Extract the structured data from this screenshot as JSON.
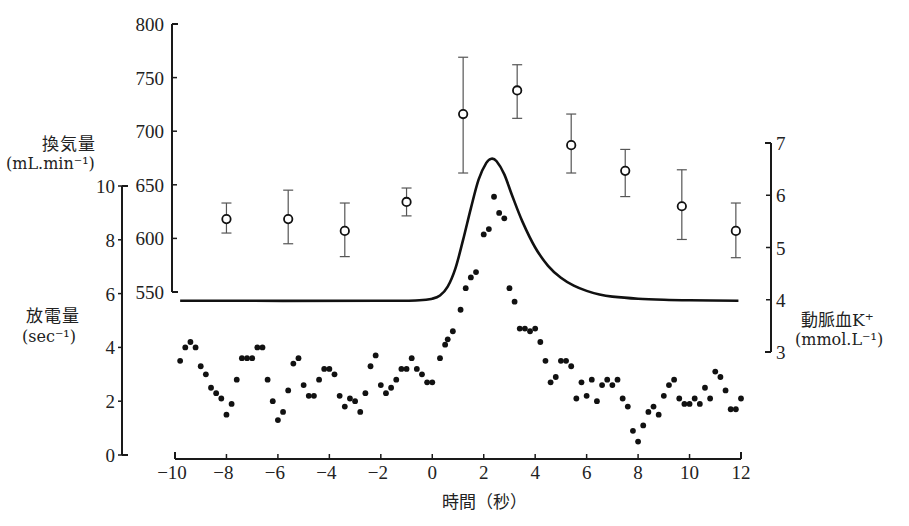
{
  "chart_data": {
    "type": "scatter",
    "title": "",
    "xlabel": "時間（秒）",
    "xlim": [
      -10,
      12
    ],
    "xticks": [
      -10,
      -8,
      -6,
      -4,
      -2,
      0,
      2,
      4,
      6,
      8,
      10,
      12
    ],
    "axes": {
      "ventilation": {
        "label": "換気量",
        "unit": "(mL.min⁻¹)",
        "ylim": [
          550,
          800
        ],
        "ticks": [
          550,
          600,
          650,
          700,
          750,
          800
        ],
        "position": "left-inner"
      },
      "discharge": {
        "label": "放電量",
        "unit": "(sec⁻¹)",
        "ylim": [
          0,
          10
        ],
        "ticks": [
          0,
          2,
          4,
          6,
          8,
          10
        ],
        "position": "left-outer"
      },
      "potassium": {
        "label": "動脈血K⁺",
        "unit": "(mmol.L⁻¹)",
        "ylim": [
          3,
          7
        ],
        "ticks": [
          3,
          4,
          5,
          6,
          7
        ],
        "position": "right"
      }
    },
    "series": [
      {
        "name": "換気量",
        "type": "scatter-errorbar",
        "marker": "open-circle",
        "axis": "ventilation",
        "points": [
          {
            "x": -8.0,
            "y": 618,
            "lo": 605,
            "hi": 633
          },
          {
            "x": -5.6,
            "y": 618,
            "lo": 595,
            "hi": 645
          },
          {
            "x": -3.4,
            "y": 607,
            "lo": 583,
            "hi": 633
          },
          {
            "x": -1.0,
            "y": 634,
            "lo": 621,
            "hi": 647
          },
          {
            "x": 1.2,
            "y": 716,
            "lo": 661,
            "hi": 769
          },
          {
            "x": 3.3,
            "y": 738,
            "lo": 712,
            "hi": 762
          },
          {
            "x": 5.4,
            "y": 687,
            "lo": 661,
            "hi": 716
          },
          {
            "x": 7.5,
            "y": 663,
            "lo": 639,
            "hi": 683
          },
          {
            "x": 9.7,
            "y": 630,
            "lo": 599,
            "hi": 664
          },
          {
            "x": 11.8,
            "y": 607,
            "lo": 582,
            "hi": 633
          }
        ]
      },
      {
        "name": "動脈血K⁺",
        "type": "line",
        "axis": "potassium",
        "points": [
          [
            -9.8,
            3.98
          ],
          [
            -2,
            3.98
          ],
          [
            -0.5,
            3.99
          ],
          [
            0,
            4.02
          ],
          [
            0.3,
            4.08
          ],
          [
            0.6,
            4.25
          ],
          [
            0.9,
            4.6
          ],
          [
            1.2,
            5.15
          ],
          [
            1.5,
            5.75
          ],
          [
            1.8,
            6.3
          ],
          [
            2.1,
            6.62
          ],
          [
            2.3,
            6.7
          ],
          [
            2.5,
            6.65
          ],
          [
            2.8,
            6.4
          ],
          [
            3.1,
            6.0
          ],
          [
            3.5,
            5.5
          ],
          [
            4.0,
            5.0
          ],
          [
            4.5,
            4.65
          ],
          [
            5.0,
            4.42
          ],
          [
            5.5,
            4.27
          ],
          [
            6.0,
            4.17
          ],
          [
            6.5,
            4.1
          ],
          [
            7.0,
            4.06
          ],
          [
            8.0,
            4.02
          ],
          [
            9.0,
            4.0
          ],
          [
            10.0,
            3.99
          ],
          [
            11.9,
            3.98
          ]
        ]
      },
      {
        "name": "放電量",
        "type": "scatter",
        "marker": "filled-dot",
        "axis": "discharge",
        "points": [
          [
            -9.8,
            3.5
          ],
          [
            -9.6,
            4.0
          ],
          [
            -9.4,
            4.2
          ],
          [
            -9.2,
            4.0
          ],
          [
            -9.0,
            3.3
          ],
          [
            -8.8,
            3.0
          ],
          [
            -8.6,
            2.5
          ],
          [
            -8.4,
            2.3
          ],
          [
            -8.2,
            2.1
          ],
          [
            -8.0,
            1.5
          ],
          [
            -7.8,
            1.9
          ],
          [
            -7.6,
            2.8
          ],
          [
            -7.4,
            3.6
          ],
          [
            -7.2,
            3.6
          ],
          [
            -7.0,
            3.6
          ],
          [
            -6.8,
            4.0
          ],
          [
            -6.6,
            4.0
          ],
          [
            -6.4,
            2.8
          ],
          [
            -6.2,
            2.0
          ],
          [
            -6.0,
            1.3
          ],
          [
            -5.8,
            1.6
          ],
          [
            -5.6,
            2.4
          ],
          [
            -5.4,
            3.4
          ],
          [
            -5.2,
            3.6
          ],
          [
            -5.0,
            2.6
          ],
          [
            -4.8,
            2.2
          ],
          [
            -4.6,
            2.2
          ],
          [
            -4.4,
            2.8
          ],
          [
            -4.2,
            3.2
          ],
          [
            -4.0,
            3.2
          ],
          [
            -3.8,
            3.0
          ],
          [
            -3.6,
            2.2
          ],
          [
            -3.4,
            1.8
          ],
          [
            -3.2,
            2.1
          ],
          [
            -3.0,
            2.0
          ],
          [
            -2.8,
            1.6
          ],
          [
            -2.6,
            2.3
          ],
          [
            -2.4,
            3.3
          ],
          [
            -2.2,
            3.7
          ],
          [
            -2.0,
            2.6
          ],
          [
            -1.8,
            2.3
          ],
          [
            -1.6,
            2.5
          ],
          [
            -1.4,
            2.8
          ],
          [
            -1.2,
            3.2
          ],
          [
            -1.0,
            3.2
          ],
          [
            -0.8,
            3.6
          ],
          [
            -0.6,
            3.2
          ],
          [
            -0.4,
            3.0
          ],
          [
            -0.2,
            2.7
          ],
          [
            0.0,
            2.7
          ],
          [
            0.3,
            3.6
          ],
          [
            0.5,
            4.1
          ],
          [
            0.6,
            4.3
          ],
          [
            0.8,
            4.6
          ],
          [
            1.1,
            5.4
          ],
          [
            1.3,
            6.2
          ],
          [
            1.5,
            6.6
          ],
          [
            1.7,
            6.8
          ],
          [
            2.0,
            8.2
          ],
          [
            2.2,
            8.4
          ],
          [
            2.4,
            9.6
          ],
          [
            2.6,
            9.0
          ],
          [
            2.8,
            8.8
          ],
          [
            3.0,
            6.2
          ],
          [
            3.2,
            5.7
          ],
          [
            3.4,
            4.7
          ],
          [
            3.6,
            4.7
          ],
          [
            3.8,
            4.6
          ],
          [
            4.0,
            4.7
          ],
          [
            4.2,
            4.2
          ],
          [
            4.4,
            3.5
          ],
          [
            4.6,
            2.7
          ],
          [
            4.8,
            2.9
          ],
          [
            5.0,
            3.5
          ],
          [
            5.2,
            3.5
          ],
          [
            5.4,
            3.3
          ],
          [
            5.6,
            2.1
          ],
          [
            5.8,
            2.7
          ],
          [
            6.0,
            2.2
          ],
          [
            6.2,
            2.8
          ],
          [
            6.4,
            2.0
          ],
          [
            6.6,
            2.6
          ],
          [
            6.8,
            2.8
          ],
          [
            7.0,
            2.6
          ],
          [
            7.2,
            2.8
          ],
          [
            7.4,
            2.1
          ],
          [
            7.6,
            1.8
          ],
          [
            7.8,
            0.9
          ],
          [
            8.0,
            0.5
          ],
          [
            8.2,
            1.1
          ],
          [
            8.4,
            1.6
          ],
          [
            8.6,
            1.8
          ],
          [
            8.8,
            1.5
          ],
          [
            9.0,
            2.2
          ],
          [
            9.2,
            2.6
          ],
          [
            9.4,
            2.8
          ],
          [
            9.6,
            2.1
          ],
          [
            9.8,
            1.9
          ],
          [
            10.0,
            1.9
          ],
          [
            10.2,
            2.1
          ],
          [
            10.4,
            1.9
          ],
          [
            10.6,
            2.5
          ],
          [
            10.8,
            2.1
          ],
          [
            11.0,
            3.1
          ],
          [
            11.2,
            2.9
          ],
          [
            11.4,
            2.4
          ],
          [
            11.6,
            1.7
          ],
          [
            11.8,
            1.7
          ],
          [
            12.0,
            2.1
          ]
        ]
      }
    ],
    "grid": false,
    "legend": null
  },
  "labels": {
    "ventilation_title": "換気量",
    "ventilation_unit": "(mL.min⁻¹)",
    "discharge_title": "放電量",
    "discharge_unit": "(sec⁻¹)",
    "potassium_title": "動脈血K⁺",
    "potassium_unit": "(mmol.L⁻¹)",
    "x_title": "時間（秒）"
  }
}
